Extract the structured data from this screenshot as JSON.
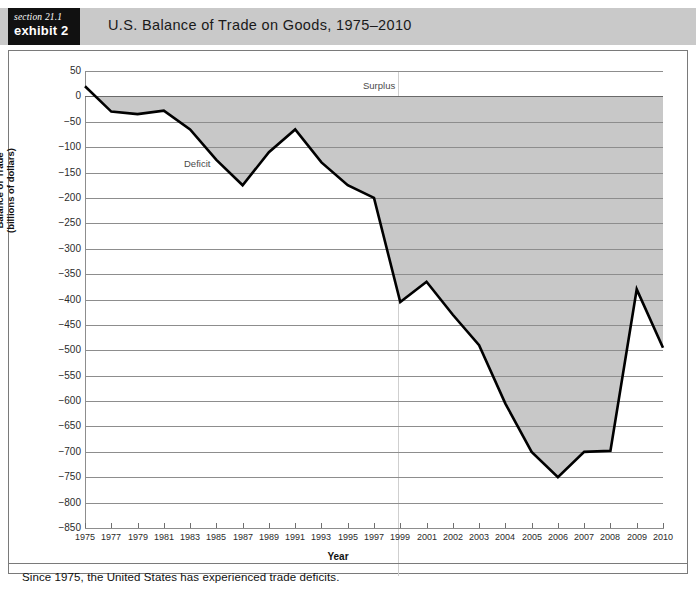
{
  "header": {
    "section_label": "section 21.1",
    "exhibit_label": "exhibit 2",
    "title": "U.S. Balance of Trade on Goods, 1975–2010"
  },
  "footer": {
    "note": "Since 1975, the United States has experienced trade deficits."
  },
  "annotations": {
    "surplus": "Surplus",
    "deficit": "Deficit"
  },
  "colors": {
    "header_band": "#c9c9c9",
    "tag_background": "#111111",
    "tag_text": "#ffffff",
    "line": "#000000",
    "deficit_fill": "#c8c8c8",
    "gridline": "#8d8d8d",
    "frame": "#7a7a7a",
    "divider": "#cfcfcf",
    "plot_background": "#ffffff"
  },
  "chart_data": {
    "type": "area",
    "title": "U.S. Balance of Trade on Goods, 1975–2010",
    "xlabel": "Year",
    "ylabel": "Balance of Trade\n(billions of dollars)",
    "ylabel_line1": "Balance of Trade",
    "ylabel_line2": "(billions of dollars)",
    "ylim": [
      -850,
      50
    ],
    "ytick_step": 50,
    "yticks": [
      50,
      0,
      -50,
      -100,
      -150,
      -200,
      -250,
      -300,
      -350,
      -400,
      -450,
      -500,
      -550,
      -600,
      -650,
      -700,
      -750,
      -800,
      -850
    ],
    "ytick_labels": [
      "50",
      "0",
      "−50",
      "−100",
      "−150",
      "−200",
      "−250",
      "−300",
      "−350",
      "−400",
      "−450",
      "−500",
      "−550",
      "−600",
      "−650",
      "−700",
      "−750",
      "−800",
      "−850"
    ],
    "grid": true,
    "legend": null,
    "xtick_labels": [
      "1975",
      "1977",
      "1979",
      "1981",
      "1983",
      "1985",
      "1987",
      "1989",
      "1991",
      "1993",
      "1995",
      "1997",
      "1999",
      "2001",
      "2002",
      "2003",
      "2004",
      "2005",
      "2006",
      "2007",
      "2008",
      "2009",
      "2010"
    ],
    "x": [
      "1975",
      "1977",
      "1979",
      "1981",
      "1983",
      "1985",
      "1987",
      "1989",
      "1991",
      "1993",
      "1995",
      "1997",
      "1999",
      "2001",
      "2002",
      "2003",
      "2004",
      "2005",
      "2006",
      "2007",
      "2008",
      "2009",
      "2010"
    ],
    "values": [
      20,
      -30,
      -35,
      -28,
      -65,
      -125,
      -175,
      -110,
      -65,
      -130,
      -175,
      -200,
      -405,
      -365,
      -430,
      -490,
      -605,
      -700,
      -750,
      -700,
      -698,
      -380,
      -495
    ],
    "series": [
      {
        "name": "Balance of trade on goods",
        "values": [
          20,
          -30,
          -35,
          -28,
          -65,
          -125,
          -175,
          -110,
          -65,
          -130,
          -175,
          -200,
          -405,
          -365,
          -430,
          -490,
          -605,
          -700,
          -750,
          -700,
          -698,
          -380,
          -495
        ]
      }
    ],
    "annotations": [
      {
        "text": "Surplus",
        "region": "above zero line"
      },
      {
        "text": "Deficit",
        "region": "below zero line"
      }
    ]
  }
}
